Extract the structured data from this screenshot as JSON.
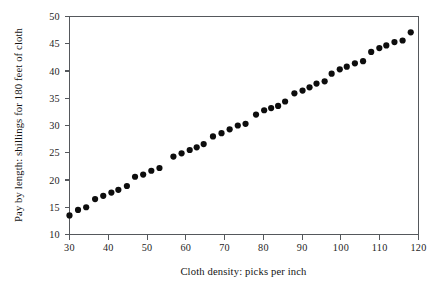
{
  "chart_data": {
    "type": "scatter",
    "title": "",
    "xlabel": "Cloth density: picks per inch",
    "ylabel": "Pay by length: shillings for 180 feet of cloth",
    "xlim": [
      30,
      120
    ],
    "ylim": [
      10,
      50
    ],
    "xticks": [
      30,
      40,
      50,
      60,
      70,
      80,
      90,
      100,
      110,
      120
    ],
    "yticks": [
      10,
      15,
      20,
      25,
      30,
      35,
      40,
      45,
      50
    ],
    "xtick_labels": [
      "30",
      "40",
      "50",
      "60",
      "70",
      "80",
      "90",
      "100",
      "110",
      "120"
    ],
    "ytick_labels": [
      "10",
      "15",
      "20",
      "25",
      "30",
      "35",
      "40",
      "45",
      "50"
    ],
    "grid": false,
    "legend": null,
    "marker": "filled-circle",
    "marker_color": "#0d0d0d",
    "marker_size_px": 3.1,
    "frame": "box",
    "background_color": "#ffffff",
    "axis_color": "#55585c",
    "points": [
      {
        "x": 30.0,
        "y": 13.5
      },
      {
        "x": 32.2,
        "y": 14.5
      },
      {
        "x": 34.3,
        "y": 15.0
      },
      {
        "x": 36.6,
        "y": 16.5
      },
      {
        "x": 38.7,
        "y": 17.1
      },
      {
        "x": 40.8,
        "y": 17.7
      },
      {
        "x": 42.6,
        "y": 18.2
      },
      {
        "x": 44.8,
        "y": 18.9
      },
      {
        "x": 46.9,
        "y": 20.6
      },
      {
        "x": 49.0,
        "y": 21.0
      },
      {
        "x": 51.1,
        "y": 21.7
      },
      {
        "x": 53.2,
        "y": 22.2
      },
      {
        "x": 56.8,
        "y": 24.3
      },
      {
        "x": 58.9,
        "y": 24.9
      },
      {
        "x": 61.0,
        "y": 25.5
      },
      {
        "x": 62.8,
        "y": 26.0
      },
      {
        "x": 64.6,
        "y": 26.6
      },
      {
        "x": 67.0,
        "y": 28.0
      },
      {
        "x": 69.2,
        "y": 28.6
      },
      {
        "x": 71.3,
        "y": 29.3
      },
      {
        "x": 73.4,
        "y": 30.0
      },
      {
        "x": 75.4,
        "y": 30.3
      },
      {
        "x": 78.1,
        "y": 32.0
      },
      {
        "x": 80.2,
        "y": 32.8
      },
      {
        "x": 82.0,
        "y": 33.2
      },
      {
        "x": 83.8,
        "y": 33.6
      },
      {
        "x": 85.6,
        "y": 34.4
      },
      {
        "x": 88.0,
        "y": 35.9
      },
      {
        "x": 90.1,
        "y": 36.4
      },
      {
        "x": 91.9,
        "y": 37.0
      },
      {
        "x": 93.7,
        "y": 37.7
      },
      {
        "x": 95.8,
        "y": 38.1
      },
      {
        "x": 97.6,
        "y": 39.5
      },
      {
        "x": 99.7,
        "y": 40.3
      },
      {
        "x": 101.5,
        "y": 40.8
      },
      {
        "x": 103.6,
        "y": 41.4
      },
      {
        "x": 105.7,
        "y": 41.8
      },
      {
        "x": 107.8,
        "y": 43.5
      },
      {
        "x": 109.9,
        "y": 44.2
      },
      {
        "x": 111.7,
        "y": 44.7
      },
      {
        "x": 113.8,
        "y": 45.3
      },
      {
        "x": 115.9,
        "y": 45.6
      },
      {
        "x": 118.0,
        "y": 47.1
      }
    ]
  }
}
